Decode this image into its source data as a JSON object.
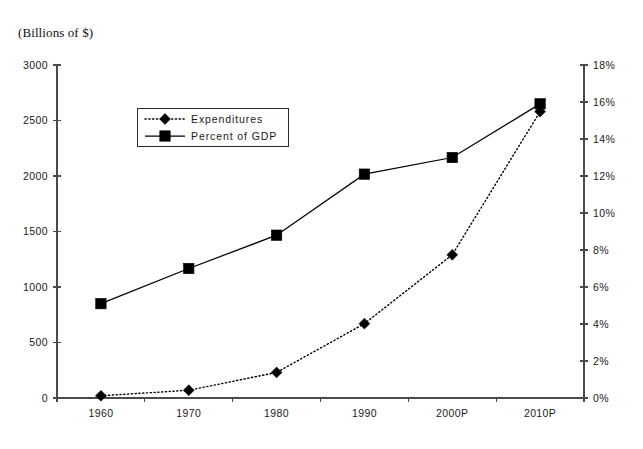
{
  "chart_data": {
    "type": "line",
    "title": "(Billions of $)",
    "xlabel": "",
    "ylabel": "(Billions of $)",
    "y2label": "",
    "grid": false,
    "legend_position": "inside-top-left",
    "categories": [
      "1960",
      "1970",
      "1980",
      "1990",
      "2000P",
      "2010P"
    ],
    "ylim": [
      0,
      3000
    ],
    "y2lim": [
      0,
      18
    ],
    "yticks": [
      "0",
      "500",
      "1000",
      "1500",
      "2000",
      "2500",
      "3000"
    ],
    "ytick_values": [
      0,
      500,
      1000,
      1500,
      2000,
      2500,
      3000
    ],
    "y2ticks": [
      "0%",
      "2%",
      "4%",
      "6%",
      "8%",
      "10%",
      "12%",
      "14%",
      "16%",
      "18%"
    ],
    "y2tick_values": [
      0,
      2,
      4,
      6,
      8,
      10,
      12,
      14,
      16,
      18
    ],
    "series": [
      {
        "name": "Expenditures",
        "axis": "left",
        "line_style": "dotted",
        "marker": "diamond",
        "color": "#000000",
        "values": [
          20,
          70,
          230,
          670,
          1290,
          2580
        ]
      },
      {
        "name": "Percent of GDP",
        "axis": "right",
        "line_style": "solid",
        "marker": "square",
        "color": "#000000",
        "values": [
          5.1,
          7.0,
          8.8,
          12.1,
          13.0,
          15.9
        ]
      }
    ]
  },
  "legend": {
    "entries": [
      {
        "label": "Expenditures",
        "marker": "diamond",
        "style": "dotted"
      },
      {
        "label": "Percent of GDP",
        "marker": "square",
        "style": "solid"
      }
    ]
  },
  "colors": {
    "ink": "#000000",
    "axis": "#4a4a4a",
    "background": "#ffffff"
  }
}
